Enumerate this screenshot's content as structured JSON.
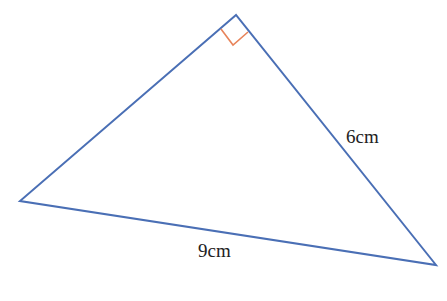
{
  "diagram": {
    "type": "right-triangle",
    "vertices": {
      "top": [
        236,
        15
      ],
      "left": [
        20,
        201
      ],
      "right": [
        436,
        265
      ]
    },
    "right_angle_at": "top",
    "right_angle_marker": {
      "points": [
        [
          221,
          29
        ],
        [
          233,
          45
        ],
        [
          248,
          32
        ]
      ]
    },
    "labels": {
      "right_leg": "6cm",
      "hypotenuse": "9cm"
    },
    "colors": {
      "edge": "#4a6fb5",
      "marker": "#e8845a",
      "text": "#222222",
      "background": "#ffffff"
    }
  }
}
